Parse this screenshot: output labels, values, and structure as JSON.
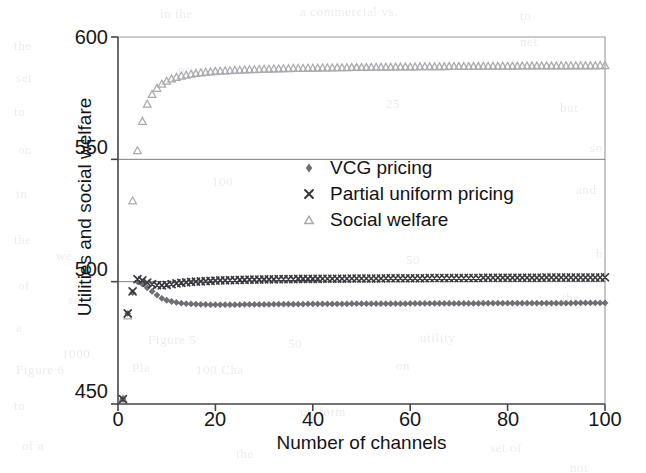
{
  "figure": {
    "background_color": "#ffffff",
    "axis_color": "#46464a",
    "text_color": "#17171a"
  },
  "axes": {
    "y_title": "Utilities and social welfare",
    "x_title": "Number of channels",
    "y_ticks": [
      "450",
      "500",
      "550",
      "600"
    ],
    "x_ticks": [
      "0",
      "20",
      "40",
      "60",
      "80",
      "100"
    ]
  },
  "legend": {
    "entries": [
      {
        "label": "VCG pricing",
        "marker": "diamond-marker",
        "color": "#6e6e74"
      },
      {
        "label": "Partial uniform pricing",
        "marker": "cross-marker",
        "color": "#3a3a3e"
      },
      {
        "label": "Social welfare",
        "marker": "triangle-marker",
        "color": "#a9a9ae"
      }
    ]
  },
  "chart_data": {
    "type": "scatter",
    "title": "",
    "xlabel": "Number of channels",
    "ylabel": "Utilities and social welfare",
    "xlim": [
      0,
      100
    ],
    "ylim": [
      450,
      600
    ],
    "xticks": [
      0,
      20,
      40,
      60,
      80,
      100
    ],
    "yticks": [
      450,
      500,
      550,
      600
    ],
    "grid": "horizontal gridlines at y = 500 and y = 550",
    "legend_position": "center, inside plot near y=520-545, x=50-85",
    "series": [
      {
        "name": "VCG pricing",
        "marker": "diamond",
        "color": "#6e6e74",
        "x": [
          1,
          2,
          3,
          4,
          5,
          6,
          7,
          8,
          9,
          10,
          11,
          12,
          13,
          14,
          15,
          16,
          17,
          18,
          19,
          20,
          21,
          22,
          23,
          24,
          25,
          26,
          27,
          28,
          29,
          30,
          31,
          32,
          33,
          34,
          35,
          36,
          37,
          38,
          39,
          40,
          41,
          42,
          43,
          44,
          45,
          46,
          47,
          48,
          49,
          50,
          51,
          52,
          53,
          54,
          55,
          56,
          57,
          58,
          59,
          60,
          61,
          62,
          63,
          64,
          65,
          66,
          67,
          68,
          69,
          70,
          71,
          72,
          73,
          74,
          75,
          76,
          77,
          78,
          79,
          80,
          81,
          82,
          83,
          84,
          85,
          86,
          87,
          88,
          89,
          90,
          91,
          92,
          93,
          94,
          95,
          96,
          97,
          98,
          99,
          100
        ],
        "y": [
          452.0,
          487.0,
          495.5,
          500.0,
          499.0,
          497.5,
          496.0,
          494.5,
          493.2,
          492.4,
          491.9,
          491.5,
          491.2,
          491.0,
          490.9,
          490.8,
          490.7,
          490.7,
          490.6,
          490.6,
          490.6,
          490.6,
          490.6,
          490.6,
          490.6,
          490.7,
          490.7,
          490.7,
          490.7,
          490.7,
          490.7,
          490.8,
          490.8,
          490.8,
          490.8,
          490.8,
          490.8,
          490.8,
          490.9,
          490.9,
          490.9,
          490.9,
          490.9,
          490.9,
          490.9,
          490.9,
          490.9,
          491.0,
          491.0,
          491.0,
          491.0,
          491.0,
          491.0,
          491.0,
          491.0,
          491.0,
          491.0,
          491.0,
          491.0,
          491.1,
          491.1,
          491.1,
          491.1,
          491.1,
          491.1,
          491.1,
          491.1,
          491.1,
          491.1,
          491.1,
          491.1,
          491.1,
          491.1,
          491.1,
          491.2,
          491.2,
          491.2,
          491.2,
          491.2,
          491.2,
          491.2,
          491.2,
          491.2,
          491.2,
          491.2,
          491.2,
          491.2,
          491.2,
          491.2,
          491.2,
          491.2,
          491.2,
          491.2,
          491.3,
          491.3,
          491.3,
          491.3,
          491.3,
          491.3,
          491.3
        ]
      },
      {
        "name": "Partial uniform pricing",
        "marker": "cross",
        "color": "#3a3a3e",
        "x": [
          1,
          2,
          3,
          4,
          5,
          6,
          7,
          8,
          9,
          10,
          11,
          12,
          13,
          14,
          15,
          16,
          17,
          18,
          19,
          20,
          21,
          22,
          23,
          24,
          25,
          26,
          27,
          28,
          29,
          30,
          31,
          32,
          33,
          34,
          35,
          36,
          37,
          38,
          39,
          40,
          41,
          42,
          43,
          44,
          45,
          46,
          47,
          48,
          49,
          50,
          51,
          52,
          53,
          54,
          55,
          56,
          57,
          58,
          59,
          60,
          61,
          62,
          63,
          64,
          65,
          66,
          67,
          68,
          69,
          70,
          71,
          72,
          73,
          74,
          75,
          76,
          77,
          78,
          79,
          80,
          81,
          82,
          83,
          84,
          85,
          86,
          87,
          88,
          89,
          90,
          91,
          92,
          93,
          94,
          95,
          96,
          97,
          98,
          99,
          100
        ],
        "y": [
          452.0,
          487.0,
          496.0,
          501.0,
          500.5,
          499.6,
          499.0,
          498.6,
          498.5,
          498.7,
          499.0,
          499.3,
          499.5,
          499.7,
          499.9,
          500.0,
          500.1,
          500.2,
          500.3,
          500.4,
          500.5,
          500.5,
          500.6,
          500.6,
          500.7,
          500.7,
          500.8,
          500.8,
          500.8,
          500.9,
          500.9,
          500.9,
          501.0,
          501.0,
          501.0,
          501.0,
          501.1,
          501.1,
          501.1,
          501.1,
          501.1,
          501.2,
          501.2,
          501.2,
          501.2,
          501.2,
          501.2,
          501.3,
          501.3,
          501.3,
          501.3,
          501.3,
          501.3,
          501.3,
          501.4,
          501.4,
          501.4,
          501.4,
          501.4,
          501.4,
          501.4,
          501.4,
          501.4,
          501.5,
          501.5,
          501.5,
          501.5,
          501.5,
          501.5,
          501.5,
          501.5,
          501.5,
          501.5,
          501.5,
          501.6,
          501.6,
          501.6,
          501.6,
          501.6,
          501.6,
          501.6,
          501.6,
          501.6,
          501.6,
          501.6,
          501.6,
          501.6,
          501.7,
          501.7,
          501.7,
          501.7,
          501.7,
          501.7,
          501.7,
          501.7,
          501.7,
          501.7,
          501.7,
          501.7,
          501.8
        ]
      },
      {
        "name": "Social welfare",
        "marker": "triangle",
        "color": "#a9a9ae",
        "x": [
          1,
          2,
          3,
          4,
          5,
          6,
          7,
          8,
          9,
          10,
          11,
          12,
          13,
          14,
          15,
          16,
          17,
          18,
          19,
          20,
          21,
          22,
          23,
          24,
          25,
          26,
          27,
          28,
          29,
          30,
          31,
          32,
          33,
          34,
          35,
          36,
          37,
          38,
          39,
          40,
          41,
          42,
          43,
          44,
          45,
          46,
          47,
          48,
          49,
          50,
          51,
          52,
          53,
          54,
          55,
          56,
          57,
          58,
          59,
          60,
          61,
          62,
          63,
          64,
          65,
          66,
          67,
          68,
          69,
          70,
          71,
          72,
          73,
          74,
          75,
          76,
          77,
          78,
          79,
          80,
          81,
          82,
          83,
          84,
          85,
          86,
          87,
          88,
          89,
          90,
          91,
          92,
          93,
          94,
          95,
          96,
          97,
          98,
          99,
          100
        ],
        "y": [
          452.0,
          486.0,
          533.0,
          553.5,
          565.5,
          572.5,
          576.5,
          579.0,
          580.7,
          581.9,
          582.8,
          583.5,
          584.0,
          584.4,
          584.8,
          585.1,
          585.3,
          585.5,
          585.7,
          585.9,
          586.0,
          586.1,
          586.2,
          586.3,
          586.4,
          586.5,
          586.6,
          586.6,
          586.7,
          586.8,
          586.8,
          586.9,
          586.9,
          587.0,
          587.0,
          587.1,
          587.1,
          587.1,
          587.2,
          587.2,
          587.2,
          587.3,
          587.3,
          587.3,
          587.4,
          587.4,
          587.4,
          587.5,
          587.5,
          587.5,
          587.5,
          587.6,
          587.6,
          587.6,
          587.6,
          587.6,
          587.7,
          587.7,
          587.7,
          587.7,
          587.7,
          587.8,
          587.8,
          587.8,
          587.8,
          587.8,
          587.8,
          587.9,
          587.9,
          587.9,
          587.9,
          587.9,
          587.9,
          587.9,
          588.0,
          588.0,
          588.0,
          588.0,
          588.0,
          588.0,
          588.0,
          588.0,
          588.1,
          588.1,
          588.1,
          588.1,
          588.1,
          588.1,
          588.1,
          588.1,
          588.2,
          588.2,
          588.2,
          588.2,
          588.2,
          588.2,
          588.2,
          588.2,
          588.3,
          588.3
        ]
      }
    ]
  },
  "scan_artifacts": {
    "lines": [
      {
        "text": "in the",
        "x": 160,
        "y": 6
      },
      {
        "text": "a commercial vs.",
        "x": 300,
        "y": 4
      },
      {
        "text": "to",
        "x": 520,
        "y": 8
      },
      {
        "text": "the",
        "x": 14,
        "y": 38
      },
      {
        "text": "net",
        "x": 520,
        "y": 34
      },
      {
        "text": "set",
        "x": 16,
        "y": 70
      },
      {
        "text": "pricing",
        "x": 178,
        "y": 62
      },
      {
        "text": "300",
        "x": 348,
        "y": 60
      },
      {
        "text": "of",
        "x": 470,
        "y": 58
      },
      {
        "text": "to",
        "x": 14,
        "y": 104
      },
      {
        "text": "25",
        "x": 386,
        "y": 96
      },
      {
        "text": "but",
        "x": 560,
        "y": 100
      },
      {
        "text": "on",
        "x": 18,
        "y": 142
      },
      {
        "text": "so",
        "x": 590,
        "y": 140
      },
      {
        "text": "100",
        "x": 212,
        "y": 174
      },
      {
        "text": "in",
        "x": 16,
        "y": 186
      },
      {
        "text": "and",
        "x": 576,
        "y": 182
      },
      {
        "text": "the",
        "x": 14,
        "y": 232
      },
      {
        "text": "we",
        "x": 56,
        "y": 248
      },
      {
        "text": "50",
        "x": 406,
        "y": 252
      },
      {
        "text": "b",
        "x": 596,
        "y": 246
      },
      {
        "text": "of",
        "x": 18,
        "y": 278
      },
      {
        "text": "some",
        "x": 68,
        "y": 292
      },
      {
        "text": "40",
        "x": 398,
        "y": 300
      },
      {
        "text": "the",
        "x": 562,
        "y": 290
      },
      {
        "text": "a",
        "x": 16,
        "y": 320
      },
      {
        "text": "Figure 5",
        "x": 148,
        "y": 332
      },
      {
        "text": "50",
        "x": 288,
        "y": 336
      },
      {
        "text": "utility",
        "x": 420,
        "y": 330
      },
      {
        "text": "1000",
        "x": 62,
        "y": 346
      },
      {
        "text": "Figure 6",
        "x": 16,
        "y": 362
      },
      {
        "text": "Pla",
        "x": 132,
        "y": 360
      },
      {
        "text": "100 Cha",
        "x": 196,
        "y": 362
      },
      {
        "text": "on",
        "x": 396,
        "y": 358
      },
      {
        "text": "to",
        "x": 14,
        "y": 398
      },
      {
        "text": "uniform",
        "x": 300,
        "y": 404
      },
      {
        "text": "of a",
        "x": 22,
        "y": 438
      },
      {
        "text": "the",
        "x": 236,
        "y": 446
      },
      {
        "text": "set of",
        "x": 490,
        "y": 440
      },
      {
        "text": "not",
        "x": 570,
        "y": 460
      }
    ]
  }
}
